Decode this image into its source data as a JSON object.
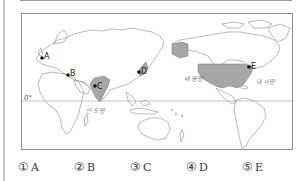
{
  "map": {
    "equator_label": "0°",
    "oceans": [
      {
        "id": "pacific",
        "label": "태평양"
      },
      {
        "id": "atlantic",
        "label": "대서양"
      },
      {
        "id": "indian",
        "label": "인도양"
      }
    ],
    "markers": [
      {
        "id": "A",
        "label": "A"
      },
      {
        "id": "B",
        "label": "B"
      },
      {
        "id": "C",
        "label": "C"
      },
      {
        "id": "D",
        "label": "D"
      },
      {
        "id": "E",
        "label": "E"
      }
    ],
    "highlighted_regions": [
      "India",
      "Japan",
      "United States",
      "Alaska"
    ],
    "colors": {
      "highlight": "#a6a6a6",
      "coastline": "#8a8a8a",
      "frame": "#8c8c8c"
    }
  },
  "answers": [
    {
      "num": "①",
      "label": "A"
    },
    {
      "num": "②",
      "label": "B"
    },
    {
      "num": "③",
      "label": "C"
    },
    {
      "num": "④",
      "label": "D"
    },
    {
      "num": "⑤",
      "label": "E"
    }
  ]
}
